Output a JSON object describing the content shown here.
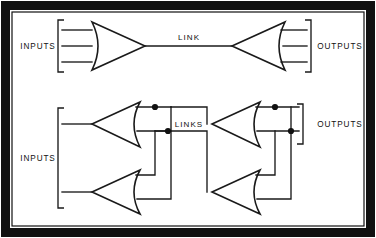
{
  "figure": {
    "background_color": "#ffffff",
    "ink_color": "#111111",
    "frame": {
      "outer_stroke_width": 9,
      "inner_stroke_width": 1.2
    }
  },
  "labels": {
    "top_inputs": "INPUTS",
    "top_outputs": "OUTPUTS",
    "top_link": "LINK",
    "bottom_inputs": "INPUTS",
    "bottom_outputs": "OUTPUTS",
    "bottom_links": "LINKS"
  },
  "diagrams": [
    {
      "name": "single-link",
      "description": "One source fan feeding one destination fan through a single link",
      "input_line_count": 3,
      "output_line_count": 3,
      "fan_count": 2,
      "link_count": 1,
      "junction_dot_count": 0
    },
    {
      "name": "multiple-links",
      "description": "Two source fans cross-connected to two destination fans through multiple links",
      "input_line_count": 2,
      "output_line_count": 2,
      "fan_count": 4,
      "link_count": 2,
      "junction_dot_count": 4
    }
  ],
  "geometry": {
    "top": {
      "left_fan": {
        "apex_x": 145,
        "apex_y": 46,
        "back_x": 92,
        "top_y": 22,
        "bottom_y": 70
      },
      "right_fan": {
        "apex_x": 232,
        "apex_y": 46,
        "back_x": 285,
        "top_y": 22,
        "bottom_y": 70
      },
      "link_y": 46,
      "link_label_x": 189,
      "link_label_y": 40,
      "input_bracket_x": 58,
      "output_bracket_x": 311,
      "input_label_x": 38,
      "output_label_x": 340,
      "stub_ys": [
        30,
        46,
        62
      ]
    },
    "bottom": {
      "fan_a": {
        "apex_x": 92,
        "apex_y": 124,
        "back_x": 140,
        "top_y": 102,
        "bottom_y": 147
      },
      "fan_b": {
        "apex_x": 92,
        "apex_y": 192,
        "back_x": 140,
        "top_y": 170,
        "bottom_y": 214
      },
      "fan_c": {
        "apex_x": 212,
        "apex_y": 124,
        "back_x": 260,
        "top_y": 102,
        "bottom_y": 147
      },
      "fan_d": {
        "apex_x": 212,
        "apex_y": 192,
        "back_x": 260,
        "top_y": 170,
        "bottom_y": 214
      },
      "links_label_x": 189,
      "links_label_y": 124,
      "input_bracket_x": 58,
      "output_bracket_x": 303,
      "input_label_x": 38,
      "output_label_x": 340
    }
  }
}
